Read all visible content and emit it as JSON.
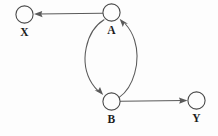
{
  "diagram": {
    "type": "directed-graph",
    "title": "",
    "background_color": "#fdfdfd",
    "stroke_color": "#5a5a5a",
    "node_stroke_color": "#4a4a4a",
    "label_color": "#1d1d1d",
    "nodes": [
      {
        "id": "X",
        "label": "X",
        "cx": 24.5,
        "cy": 14.5,
        "r": 8.6,
        "label_x": 14.5,
        "label_y": 26.5
      },
      {
        "id": "A",
        "label": "A",
        "cx": 111.5,
        "cy": 12.5,
        "r": 8.6,
        "label_x": 101.5,
        "label_y": 25.0
      },
      {
        "id": "B",
        "label": "B",
        "cx": 111.5,
        "cy": 101.5,
        "r": 8.6,
        "label_x": 101.5,
        "label_y": 114.0
      },
      {
        "id": "Y",
        "label": "Y",
        "cx": 196.5,
        "cy": 100.5,
        "r": 8.6,
        "label_x": 186.5,
        "label_y": 113.0
      }
    ],
    "edges": [
      {
        "id": "A-to-X",
        "from": "A",
        "to": "X",
        "shape": "straight",
        "direction": "left",
        "label": ""
      },
      {
        "id": "A-to-B",
        "from": "A",
        "to": "B",
        "shape": "curved-left",
        "direction": "down",
        "label": ""
      },
      {
        "id": "B-to-A",
        "from": "B",
        "to": "A",
        "shape": "curved-right",
        "direction": "up",
        "label": ""
      },
      {
        "id": "B-to-Y",
        "from": "B",
        "to": "Y",
        "shape": "straight",
        "direction": "right",
        "label": ""
      }
    ]
  }
}
